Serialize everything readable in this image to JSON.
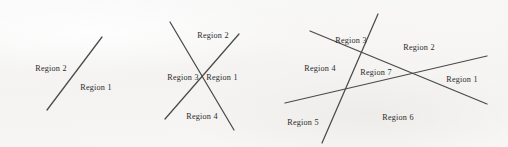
{
  "figure": {
    "background_color": "#f7f6f4",
    "line_color": "#4a4a4a",
    "text_color": "#2b2b2b",
    "width": 508,
    "height": 147
  },
  "diagrams": [
    {
      "id": "diagram-1-line",
      "line_count": 1,
      "region_count": 2,
      "lines": [
        {
          "id": "line-1",
          "x1": 47,
          "y1": 110,
          "x2": 102,
          "y2": 37
        }
      ],
      "labels": [
        {
          "id": "region-2",
          "text": "Region 2",
          "x": 51,
          "y": 69
        },
        {
          "id": "region-1",
          "text": "Region 1",
          "x": 96,
          "y": 88
        }
      ]
    },
    {
      "id": "diagram-2-lines",
      "line_count": 2,
      "region_count": 4,
      "lines": [
        {
          "id": "line-1",
          "x1": 170,
          "y1": 22,
          "x2": 234,
          "y2": 130
        },
        {
          "id": "line-2",
          "x1": 165,
          "y1": 119,
          "x2": 239,
          "y2": 34
        }
      ],
      "labels": [
        {
          "id": "region-2",
          "text": "Region 2",
          "x": 213,
          "y": 36
        },
        {
          "id": "region-3",
          "text": "Region 3",
          "x": 183,
          "y": 78
        },
        {
          "id": "region-1",
          "text": "Region 1",
          "x": 222,
          "y": 78
        },
        {
          "id": "region-4",
          "text": "Region 4",
          "x": 202,
          "y": 117
        }
      ]
    },
    {
      "id": "diagram-3-lines",
      "line_count": 3,
      "region_count": 7,
      "lines": [
        {
          "id": "line-1",
          "x1": 310,
          "y1": 31,
          "x2": 487,
          "y2": 104
        },
        {
          "id": "line-2",
          "x1": 285,
          "y1": 103,
          "x2": 487,
          "y2": 56
        },
        {
          "id": "line-3",
          "x1": 378,
          "y1": 14,
          "x2": 322,
          "y2": 143
        }
      ],
      "labels": [
        {
          "id": "region-3",
          "text": "Region 3",
          "x": 351,
          "y": 41
        },
        {
          "id": "region-2",
          "text": "Region 2",
          "x": 419,
          "y": 48
        },
        {
          "id": "region-4",
          "text": "Region 4",
          "x": 320,
          "y": 69
        },
        {
          "id": "region-7",
          "text": "Region 7",
          "x": 376,
          "y": 73
        },
        {
          "id": "region-1",
          "text": "Region 1",
          "x": 462,
          "y": 80
        },
        {
          "id": "region-5",
          "text": "Region 5",
          "x": 303,
          "y": 123
        },
        {
          "id": "region-6",
          "text": "Region 6",
          "x": 398,
          "y": 118
        }
      ]
    }
  ]
}
